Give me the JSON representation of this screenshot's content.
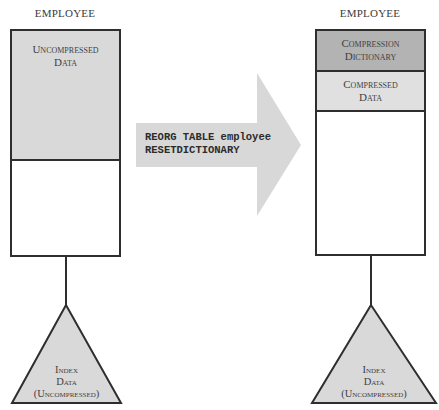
{
  "left": {
    "title": "EMPLOYEE",
    "segments": [
      {
        "label_line1": "Uncompressed",
        "label_line2": "Data",
        "fill": "#d9d9d9"
      },
      {
        "label_line1": "",
        "label_line2": "",
        "fill": "#ffffff"
      }
    ],
    "index": {
      "line1": "Index",
      "line2": "Data",
      "line3": "(Uncompressed)",
      "fill": "#d9d9d9"
    }
  },
  "arrow": {
    "line1": "REORG TABLE employee",
    "line2": "RESETDICTIONARY",
    "fill": "#d8d8d8"
  },
  "right": {
    "title": "EMPLOYEE",
    "segments": [
      {
        "label_line1": "Compression",
        "label_line2": "Dictionary",
        "fill": "#b3b3b3"
      },
      {
        "label_line1": "Compressed",
        "label_line2": "Data",
        "fill": "#e0e0e0"
      },
      {
        "label_line1": "",
        "label_line2": "",
        "fill": "#ffffff"
      }
    ],
    "index": {
      "line1": "Index",
      "line2": "Data",
      "line3": "(Uncompressed)",
      "fill": "#d9d9d9"
    }
  },
  "colors": {
    "stroke": "#2e2e2e"
  }
}
